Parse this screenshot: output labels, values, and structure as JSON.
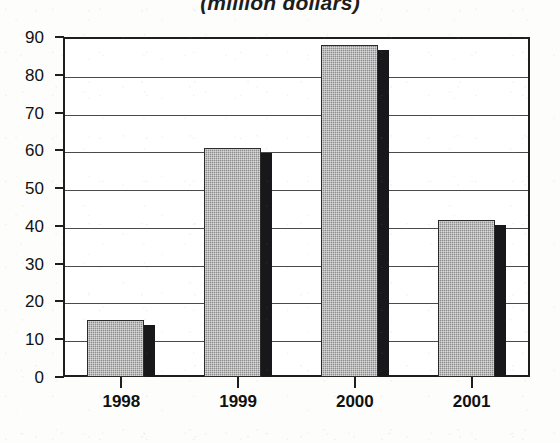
{
  "chart_data": {
    "type": "bar",
    "title": "(million dollars)",
    "xlabel": "",
    "ylabel": "",
    "categories": [
      "1998",
      "1999",
      "2000",
      "2001"
    ],
    "values": [
      15,
      60.5,
      88,
      41.5
    ],
    "ylim": [
      0,
      90
    ],
    "yticks": [
      "0",
      "10",
      "20",
      "30",
      "40",
      "50",
      "60",
      "70",
      "80",
      "90"
    ],
    "ytick_values": [
      0,
      10,
      20,
      30,
      40,
      50,
      60,
      70,
      80,
      90
    ],
    "grid": true,
    "legend": null,
    "series": [
      {
        "name": "value",
        "values": [
          15,
          60.5,
          88,
          41.5
        ]
      }
    ],
    "style": {
      "bar_face_color": "#8e8e8e",
      "bar_side_color": "#18181a",
      "axis_color": "#1e1e1e",
      "gridline_color": "#4a4a4a",
      "plot_background": "#ffffff",
      "page_background": "#fdfdfc",
      "text_color": "#111111"
    }
  }
}
